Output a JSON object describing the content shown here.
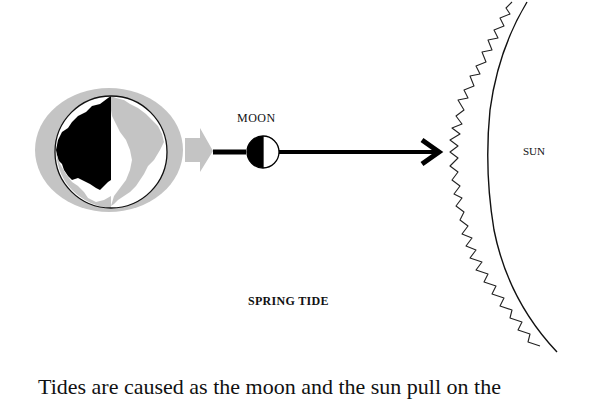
{
  "diagram": {
    "title": "SPRING TIDE",
    "labels": {
      "moon": "MOON",
      "sun": "SUN"
    },
    "elements": [
      {
        "name": "earth",
        "description": "Earth with half-shaded globe surrounded by gray tidal bulge ellipse"
      },
      {
        "name": "tidal-force-arrow",
        "description": "Gray arrow pointing right from Earth"
      },
      {
        "name": "moon",
        "description": "Half-lit moon (left dark, right light)"
      },
      {
        "name": "alignment-arrow",
        "description": "Black arrow from Earth through Moon toward Sun"
      },
      {
        "name": "sun",
        "description": "Edge of Sun with corona wisps"
      }
    ],
    "colors": {
      "bulge": "#c4c4c4",
      "ink": "#111111",
      "land_light": "#c4c4c4",
      "background": "#ffffff"
    }
  },
  "caption": {
    "text": "Tides are caused as the moon and the sun pull on the"
  }
}
